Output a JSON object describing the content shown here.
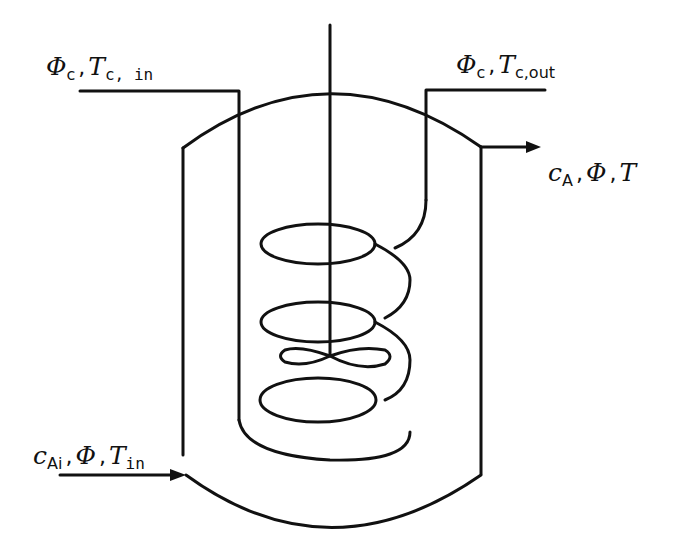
{
  "diagram": {
    "type": "cstr-with-cooling-coil",
    "colors": {
      "line": "#111111",
      "background": "#ffffff"
    },
    "labels": {
      "coolant_in": {
        "sym1": "Φ",
        "sub1": "c",
        "sep": ",",
        "sym2": "T",
        "sub2": "c, in"
      },
      "coolant_out": {
        "sym1": "Φ",
        "sub1": "c",
        "sep": ",",
        "sym2": "T",
        "sub2": "c,out"
      },
      "product_out": {
        "sym1": "c",
        "sub1": "A",
        "sep1": ",",
        "sym2": "Φ",
        "sep2": ",",
        "sym3": "T"
      },
      "feed_in": {
        "sym1": "c",
        "sub1": "Ai",
        "sep1": ",",
        "sym2": "Φ",
        "sep2": ",",
        "sym3": "T",
        "sub3": "in"
      }
    },
    "components": [
      "vessel",
      "stirrer-shaft",
      "cooling-coil",
      "coolant-inlet-pipe",
      "coolant-outlet-pipe",
      "feed-inlet-arrow",
      "product-outlet-arrow"
    ]
  }
}
